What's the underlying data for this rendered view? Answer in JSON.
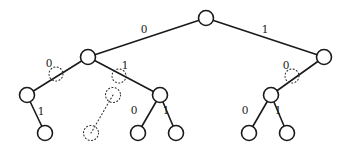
{
  "diagram": {
    "type": "binary-tree",
    "nodes": [
      {
        "id": "root",
        "x": 206,
        "y": 18,
        "style": "solid"
      },
      {
        "id": "n0",
        "x": 88,
        "y": 57,
        "style": "solid"
      },
      {
        "id": "n1",
        "x": 324,
        "y": 57,
        "style": "solid"
      },
      {
        "id": "n00",
        "x": 27,
        "y": 95,
        "style": "solid"
      },
      {
        "id": "n01",
        "x": 160,
        "y": 95,
        "style": "solid"
      },
      {
        "id": "n10",
        "x": 271,
        "y": 95,
        "style": "solid"
      },
      {
        "id": "n001",
        "x": 45,
        "y": 133,
        "style": "solid"
      },
      {
        "id": "n010",
        "x": 138,
        "y": 133,
        "style": "solid"
      },
      {
        "id": "n011",
        "x": 176,
        "y": 133,
        "style": "solid"
      },
      {
        "id": "n100",
        "x": 249,
        "y": 133,
        "style": "solid"
      },
      {
        "id": "n101",
        "x": 287,
        "y": 133,
        "style": "solid"
      },
      {
        "id": "ghost1",
        "x": 113,
        "y": 95,
        "style": "dotted"
      },
      {
        "id": "ghost2",
        "x": 91,
        "y": 133,
        "style": "dotted"
      }
    ],
    "edges": [
      {
        "from": "root",
        "to": "n0",
        "label": "0",
        "lx": 144,
        "ly": 33,
        "style": "solid"
      },
      {
        "from": "root",
        "to": "n1",
        "label": "1",
        "lx": 265,
        "ly": 33,
        "style": "solid"
      },
      {
        "from": "n0",
        "to": "n00",
        "label": "0",
        "lx": 49,
        "ly": 67,
        "style": "solid"
      },
      {
        "from": "n0",
        "to": "n01",
        "label": "1",
        "lx": 125,
        "ly": 69,
        "style": "solid"
      },
      {
        "from": "n1",
        "to": "n10",
        "label": "0",
        "lx": 286,
        "ly": 69,
        "style": "solid"
      },
      {
        "from": "n00",
        "to": "n001",
        "label": "1",
        "lx": 41,
        "ly": 115,
        "style": "solid"
      },
      {
        "from": "n01",
        "to": "n010",
        "label": "0",
        "lx": 134,
        "ly": 114,
        "style": "solid"
      },
      {
        "from": "n01",
        "to": "n011",
        "label": "1",
        "lx": 166,
        "ly": 114,
        "style": "solid"
      },
      {
        "from": "n10",
        "to": "n100",
        "label": "0",
        "lx": 245,
        "ly": 114,
        "style": "solid"
      },
      {
        "from": "n10",
        "to": "n101",
        "label": "1",
        "lx": 278,
        "ly": 114,
        "style": "solid"
      },
      {
        "from": "ghost1",
        "to": "ghost2",
        "label": "",
        "style": "dotted"
      }
    ],
    "dotted_markers": [
      {
        "x": 56,
        "y": 74,
        "r": 7
      },
      {
        "x": 119,
        "y": 76,
        "r": 7
      },
      {
        "x": 292,
        "y": 76,
        "r": 7
      }
    ],
    "node_radius": 7.5
  }
}
